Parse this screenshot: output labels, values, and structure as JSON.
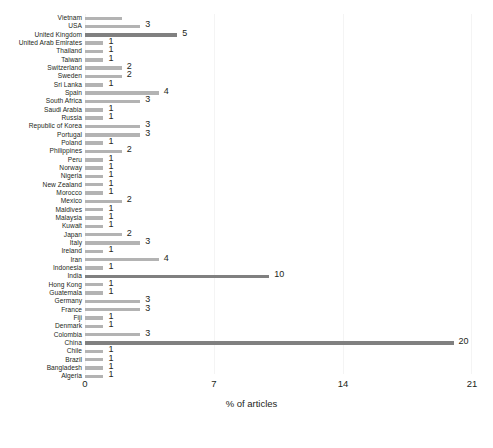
{
  "chart_data": {
    "type": "bar",
    "orientation": "horizontal",
    "title": "",
    "subtitle": "",
    "xlabel": "% of articles",
    "ylabel": "",
    "xlim": [
      0,
      21
    ],
    "xticks": [
      0,
      7,
      14,
      21
    ],
    "xtick_labels": [
      "0",
      "7",
      "14",
      "21"
    ],
    "grid": "vertical-faint",
    "legend": "none",
    "bar_color": "#b3b3b3",
    "bar_color_highlight": "#808080",
    "categories": [
      "Vietnam",
      "USA",
      "United Kingdom",
      "United Arab Emirates",
      "Thailand",
      "Taiwan",
      "Switzerland",
      "Sweden",
      "Sri Lanka",
      "Spain",
      "South Africa",
      "Saudi Arabia",
      "Russia",
      "Republic of Korea",
      "Portugal",
      "Poland",
      "Philippines",
      "Peru",
      "Norway",
      "Nigeria",
      "New Zealand",
      "Morocco",
      "Mexico",
      "Maldives",
      "Malaysia",
      "Kuwait",
      "Japan",
      "Italy",
      "Ireland",
      "Iran",
      "Indonesia",
      "India",
      "Hong Kong",
      "Guatemala",
      "Germany",
      "France",
      "Fiji",
      "Denmark",
      "Colombia",
      "China",
      "Chile",
      "Brazil",
      "Bangladesh",
      "Algeria"
    ],
    "values": [
      2,
      3,
      5,
      1,
      1,
      1,
      2,
      2,
      1,
      4,
      3,
      1,
      1,
      3,
      3,
      1,
      2,
      1,
      1,
      1,
      1,
      1,
      2,
      1,
      1,
      1,
      2,
      3,
      1,
      4,
      1,
      10,
      1,
      1,
      3,
      3,
      1,
      1,
      3,
      20,
      1,
      1,
      1,
      1
    ],
    "value_labels": [
      "",
      "3",
      "5",
      "1",
      "1",
      "1",
      "2",
      "2",
      "1",
      "4",
      "3",
      "1",
      "1",
      "3",
      "3",
      "1",
      "2",
      "1",
      "1",
      "1",
      "1",
      "1",
      "2",
      "1",
      "1",
      "1",
      "2",
      "3",
      "1",
      "4",
      "1",
      "10",
      "1",
      "1",
      "3",
      "3",
      "1",
      "1",
      "3",
      "20",
      "1",
      "1",
      "1",
      "1"
    ],
    "highlighted": [
      "United Kingdom",
      "India",
      "China"
    ]
  }
}
